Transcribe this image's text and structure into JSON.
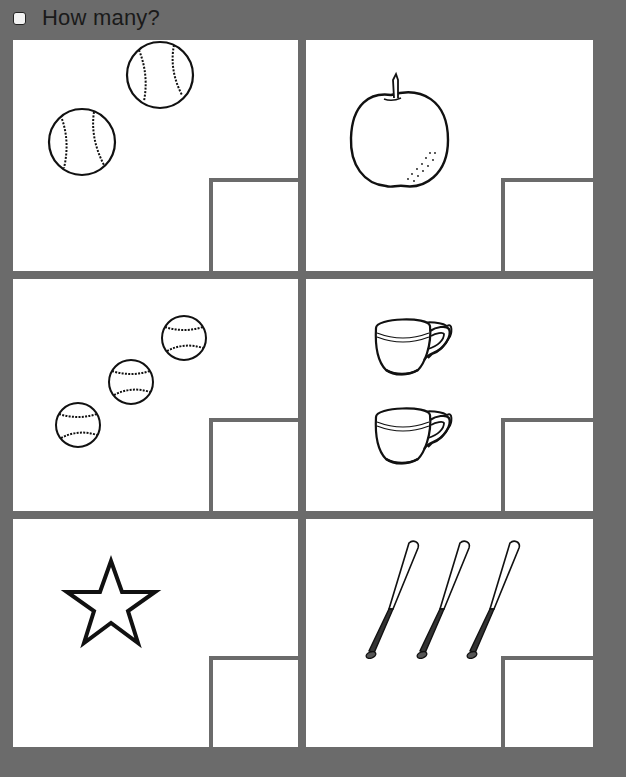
{
  "header": {
    "title": "How many?",
    "checkbox_checked": false
  },
  "colors": {
    "background": "#6b6b6b",
    "panel": "#ffffff",
    "ink": "#111111"
  },
  "panels": [
    {
      "id": "baseballs-2",
      "object": "baseball",
      "count": 2,
      "answer": ""
    },
    {
      "id": "apple-1",
      "object": "apple",
      "count": 1,
      "answer": ""
    },
    {
      "id": "baseballs-3",
      "object": "baseball",
      "count": 3,
      "answer": ""
    },
    {
      "id": "cups-2",
      "object": "teacup",
      "count": 2,
      "answer": ""
    },
    {
      "id": "star-1",
      "object": "star",
      "count": 1,
      "answer": ""
    },
    {
      "id": "bats-3",
      "object": "baseball-bat",
      "count": 3,
      "answer": ""
    }
  ]
}
